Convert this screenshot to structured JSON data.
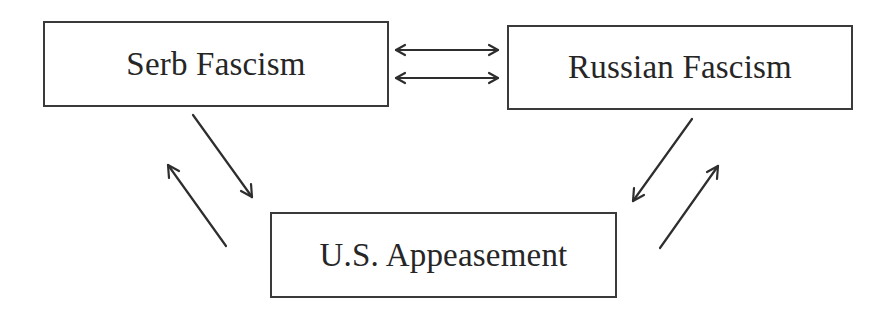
{
  "diagram": {
    "nodes": [
      {
        "id": "serb",
        "label": "Serb Fascism"
      },
      {
        "id": "russian",
        "label": "Russian Fascism"
      },
      {
        "id": "us",
        "label": "U.S. Appeasement"
      }
    ],
    "edges": [
      {
        "from": "serb",
        "to": "russian",
        "type": "bidirectional"
      },
      {
        "from": "serb",
        "to": "russian",
        "type": "bidirectional"
      },
      {
        "from": "serb",
        "to": "us",
        "type": "directed"
      },
      {
        "from": "us",
        "to": "serb",
        "type": "directed"
      },
      {
        "from": "russian",
        "to": "us",
        "type": "directed"
      },
      {
        "from": "us",
        "to": "russian",
        "type": "directed"
      }
    ],
    "colors": {
      "stroke": "#2e2e2e",
      "text": "#262626",
      "background": "#ffffff"
    }
  }
}
